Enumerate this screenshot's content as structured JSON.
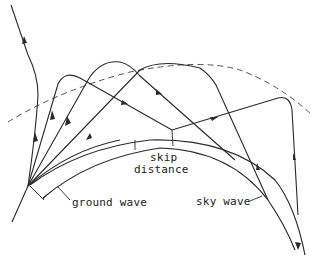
{
  "diagram": {
    "labels": {
      "skip": "skip",
      "distance": "distance",
      "ground_wave": "ground wave",
      "sky_wave": "sky wave"
    },
    "elements": {
      "earth_surface": "curved earth surface (double line)",
      "ionosphere": "dashed ionospheric layer",
      "transmitter": "source point at lower left",
      "rays": [
        "escaping ray",
        "sky wave ray 1",
        "sky wave ray 2",
        "sky wave ray 3",
        "sky wave ray 4",
        "ground wave"
      ]
    },
    "colors": {
      "line": "#2a2a2a",
      "dashed": "#555555",
      "background": "#ffffff"
    }
  }
}
